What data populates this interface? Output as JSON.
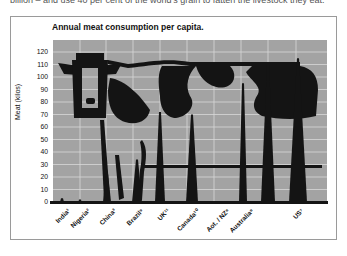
{
  "page": {
    "top_text": "billion – and use 40 per cent of the world's grain to fatten the livestock they eat."
  },
  "chart_data": {
    "type": "bar",
    "title": "Annual meat consumption per capita.",
    "xlabel": "",
    "ylabel": "Meat (kilos)",
    "ylim": [
      0,
      125
    ],
    "yticks": [
      0,
      10,
      20,
      30,
      40,
      50,
      60,
      70,
      80,
      90,
      100,
      110,
      120
    ],
    "grid": true,
    "legend": "none",
    "categories": [
      "India¹",
      "Nigeria²",
      "China³",
      "Brazil⁹",
      "UK¹¹",
      "Canada¹⁰",
      "Aot. / NZ⁸",
      "Australia⁸",
      "US⁷"
    ],
    "values": [
      3,
      2,
      23,
      34,
      72,
      70,
      95,
      110,
      115
    ],
    "annotations": [
      "Pictogram: silhouette of a cow overlaid on column spikes"
    ],
    "colors": {
      "plot_bg": "#a3a3a3",
      "ink": "#141414",
      "grid": "#d8d8d8"
    }
  }
}
